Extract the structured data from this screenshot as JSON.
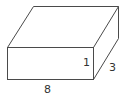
{
  "diagram": {
    "type": "rectangular-prism",
    "colors": {
      "stroke": "#4a4a4a",
      "label": "#333333",
      "background": "#ffffff"
    },
    "dimensions": {
      "length": {
        "value": "8",
        "x": 44,
        "y": 93
      },
      "height": {
        "value": "1",
        "x": 83,
        "y": 66
      },
      "depth": {
        "value": "3",
        "x": 109,
        "y": 71
      }
    },
    "vertices": {
      "front_top_left": [
        7,
        47
      ],
      "front_top_right": [
        93,
        47
      ],
      "front_bottom_left": [
        7,
        79
      ],
      "front_bottom_right": [
        93,
        79
      ],
      "back_top_left": [
        33,
        6
      ],
      "back_top_right": [
        118,
        6
      ],
      "back_bottom_right": [
        118,
        38
      ]
    }
  }
}
